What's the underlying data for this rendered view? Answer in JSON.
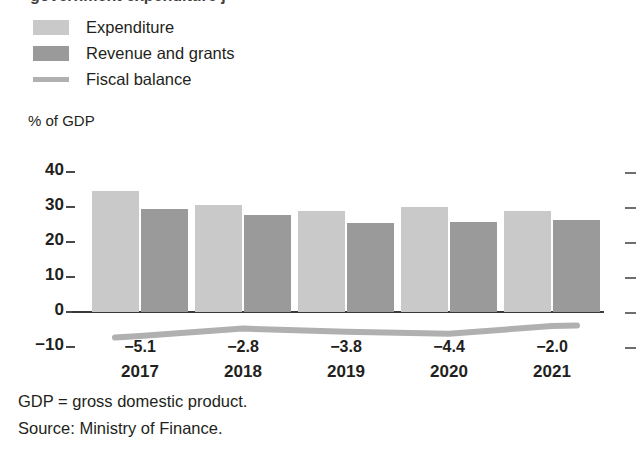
{
  "figure": {
    "cut_title": "government expenditure j",
    "axis_title": "% of GDP",
    "footnotes": [
      "GDP = gross domestic product.",
      "Source: Ministry of Finance."
    ]
  },
  "legend": {
    "items": [
      {
        "label": "Expenditure",
        "marker": "light-square-swatch",
        "color": "#c9c9c9"
      },
      {
        "label": "Revenue and grants",
        "marker": "dark-square-swatch",
        "color": "#9a9a9a"
      },
      {
        "label": "Fiscal balance",
        "marker": "thick-line-swatch",
        "color": "#b0b0b0"
      }
    ]
  },
  "colors": {
    "expenditure": "#c9c9c9",
    "revenue": "#9a9a9a",
    "fiscal_balance": "#b0b0b0",
    "axis": "#3a3a3a",
    "text": "#231f20",
    "background": "#ffffff"
  },
  "chart_data": {
    "type": "bar",
    "title": "",
    "xlabel": "",
    "ylabel": "% of GDP",
    "ylim": [
      -10,
      40
    ],
    "yticks": [
      40,
      30,
      20,
      10,
      0,
      -10
    ],
    "grid": false,
    "legend_position": "top-left",
    "categories": [
      "2017",
      "2018",
      "2019",
      "2020",
      "2021"
    ],
    "series": [
      {
        "name": "Expenditure",
        "type": "bar",
        "color": "#c9c9c9",
        "values": [
          34.5,
          30.5,
          29.0,
          30.0,
          29.0
        ]
      },
      {
        "name": "Revenue and grants",
        "type": "bar",
        "color": "#9a9a9a",
        "values": [
          29.5,
          27.7,
          25.5,
          25.8,
          26.4
        ]
      },
      {
        "name": "Fiscal balance",
        "type": "line",
        "color": "#b0b0b0",
        "values": [
          -5.1,
          -2.8,
          -3.8,
          -4.4,
          -2.0
        ],
        "data_labels": [
          "−5.1",
          "−2.8",
          "−3.8",
          "−4.4",
          "−2.0"
        ]
      }
    ]
  }
}
